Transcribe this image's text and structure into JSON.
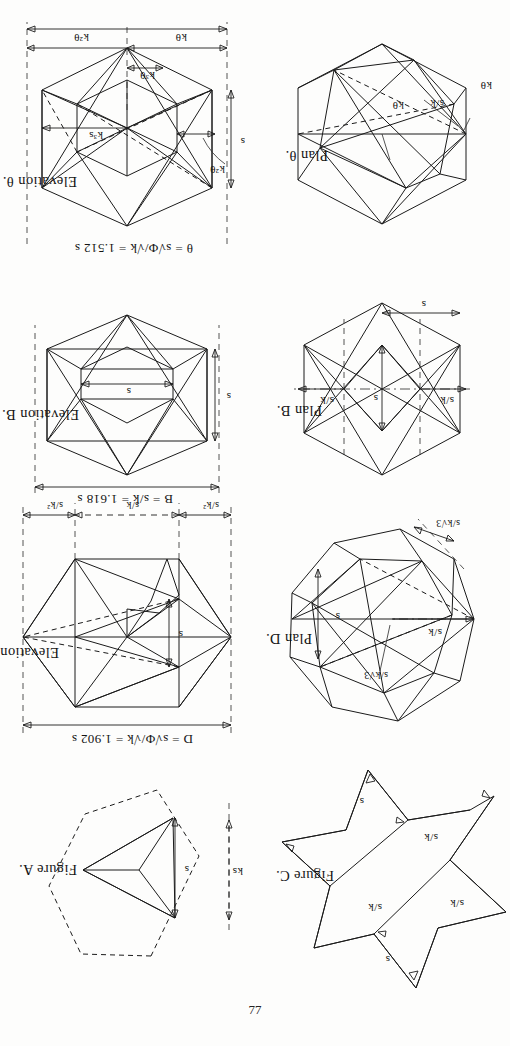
{
  "page": {
    "number": "77",
    "orientation": "rotated-180",
    "ink_color": "#1b1b1b",
    "paper_color": "#fdfdfc"
  },
  "figures": [
    {
      "id": "elevation-theta",
      "caption": "Elevation θ.",
      "span_formula": "θ = s√Φ/√k = 1.512 s",
      "span_value": "1.512 s",
      "labels": {
        "height": "s",
        "left_offset": "k²θ",
        "bottom_left": "kθ",
        "bottom_mid": "k³θ",
        "bottom_right": "k²θ",
        "inner": "k³s"
      }
    },
    {
      "id": "plan-theta",
      "caption": "Plan θ.",
      "labels": {
        "outer_left": "kθ",
        "inner_diag": "s/k",
        "inner_right": "kθ"
      }
    },
    {
      "id": "elevation-b",
      "caption": "Elevation B.",
      "span_formula": "B = s/k = 1.618 s",
      "span_value": "1.618 s",
      "labels": {
        "height": "s",
        "width_inner": "s"
      }
    },
    {
      "id": "plan-b",
      "caption": "Plan B.",
      "labels": {
        "left": "s/k",
        "center": "s",
        "right": "s/k",
        "bottom": "s"
      }
    },
    {
      "id": "elevation-d",
      "caption": "Elevation D.",
      "span_formula": "D = s√Φ/√k = 1.902 s",
      "span_value": "1.902 s",
      "labels": {
        "height": "s",
        "bottom_left": "s/k²",
        "bottom_mid": "s/k",
        "bottom_right": "s/k²"
      }
    },
    {
      "id": "plan-d",
      "caption": "Plan D.",
      "labels": {
        "radial": "s/k",
        "right": "s",
        "upper_fraction": "s/k√3",
        "lower_fraction": "s/k√3"
      }
    },
    {
      "id": "figure-a",
      "caption": "Figure A.",
      "labels": {
        "outer": "ks",
        "inner": "s"
      }
    },
    {
      "id": "figure-c",
      "caption": "Figure C.",
      "labels": {
        "top_edge": "s",
        "upper_left": "s/k",
        "upper_right": "s/k",
        "lower_left": "s/k",
        "bottom_edge": "s"
      }
    }
  ]
}
